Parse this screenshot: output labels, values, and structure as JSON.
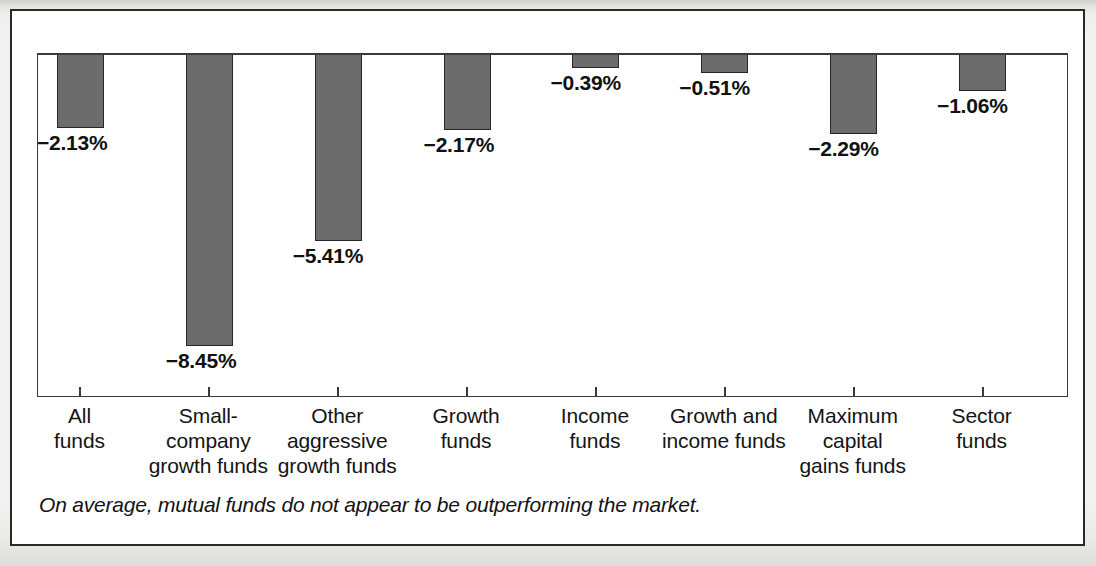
{
  "figure": {
    "caption": "On average, mutual funds do not appear to be outperforming the market.",
    "bar_color": "#6c6c6c",
    "bar_border_color": "#262626",
    "frame_color": "#2a2a2a",
    "text_color": "#131313"
  },
  "chart_data": {
    "type": "bar",
    "title": "",
    "xlabel": "",
    "ylabel": "",
    "grid": false,
    "legend": "none",
    "ylim": [
      -9.2,
      0
    ],
    "unit": "%",
    "orientation": "downward-from-zero",
    "categories": [
      "All funds",
      "Small-company growth funds",
      "Other aggressive growth funds",
      "Growth funds",
      "Income funds",
      "Growth and income funds",
      "Maximum capital gains funds",
      "Sector funds"
    ],
    "category_lines": [
      [
        "All",
        "funds"
      ],
      [
        "Small-company",
        "growth funds"
      ],
      [
        "Other",
        "aggressive",
        "growth funds"
      ],
      [
        "Growth",
        "funds"
      ],
      [
        "Income",
        "funds"
      ],
      [
        "Growth and",
        "income funds"
      ],
      [
        "Maximum",
        "capital",
        "gains funds"
      ],
      [
        "Sector",
        "funds"
      ]
    ],
    "values": [
      -2.13,
      -8.45,
      -5.41,
      -2.17,
      -0.39,
      -0.51,
      -2.29,
      -1.06
    ],
    "value_labels": [
      "−2.13%",
      "−8.45%",
      "−5.41%",
      "−2.17%",
      "−0.39%",
      "−0.51%",
      "−2.29%",
      "−1.06%"
    ]
  }
}
